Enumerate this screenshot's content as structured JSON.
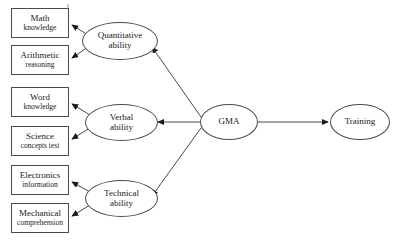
{
  "diagram": {
    "type": "path-diagram",
    "background_color": "#ffffff",
    "stroke_color": "#4a4a4a",
    "text_color": "#1a1a1a",
    "indicators": [
      {
        "id": "math-knowledge",
        "line1": "Math",
        "line2": "knowledge"
      },
      {
        "id": "arithmetic-reasoning",
        "line1": "Arithmetic",
        "line2": "reasoning"
      },
      {
        "id": "word-knowledge",
        "line1": "Word",
        "line2": "knowledge"
      },
      {
        "id": "science-concepts-test",
        "line1": "Science",
        "line2": "concepts test"
      },
      {
        "id": "electronics-information",
        "line1": "Electronics",
        "line2": "information"
      },
      {
        "id": "mechanical-comprehension",
        "line1": "Mechanical",
        "line2": "comprehension"
      }
    ],
    "abilities": [
      {
        "id": "quantitative-ability",
        "line1": "Quantitative",
        "line2": "ability"
      },
      {
        "id": "verbal-ability",
        "line1": "Verbal",
        "line2": "ability"
      },
      {
        "id": "technical-ability",
        "line1": "Technical",
        "line2": "ability"
      }
    ],
    "factors": [
      {
        "id": "gma",
        "line1": "GMA"
      },
      {
        "id": "training",
        "line1": "Training"
      }
    ],
    "edges": [
      {
        "from": "quantitative-ability",
        "to": "math-knowledge"
      },
      {
        "from": "quantitative-ability",
        "to": "arithmetic-reasoning"
      },
      {
        "from": "verbal-ability",
        "to": "word-knowledge"
      },
      {
        "from": "verbal-ability",
        "to": "science-concepts-test"
      },
      {
        "from": "technical-ability",
        "to": "electronics-information"
      },
      {
        "from": "technical-ability",
        "to": "mechanical-comprehension"
      },
      {
        "from": "gma",
        "to": "quantitative-ability"
      },
      {
        "from": "gma",
        "to": "verbal-ability"
      },
      {
        "from": "gma",
        "to": "technical-ability"
      },
      {
        "from": "gma",
        "to": "training"
      }
    ]
  }
}
